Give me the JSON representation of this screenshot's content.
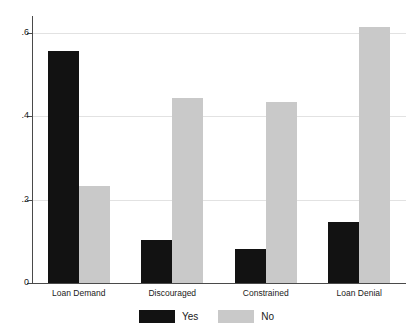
{
  "chart_data": {
    "type": "bar",
    "title": "",
    "subtitle": "",
    "xlabel": "",
    "ylabel": "",
    "categories": [
      "Loan Demand",
      "Discouraged",
      "Constrained",
      "Loan Denial"
    ],
    "series": [
      {
        "name": "Yes",
        "color": "#121212",
        "values": [
          0.558,
          0.103,
          0.082,
          0.146
        ]
      },
      {
        "name": "No",
        "color": "#c9c9c9",
        "values": [
          0.233,
          0.443,
          0.434,
          0.614
        ]
      }
    ],
    "ylim": [
      0,
      0.65
    ],
    "yticks": [
      0,
      0.2,
      0.4,
      0.6
    ],
    "ytick_labels": [
      "0",
      ".2",
      ".4",
      ".6"
    ],
    "grid": "horizontal",
    "grid_color": "#e2e2e2",
    "legend_position": "bottom",
    "axis_color": "#4a4a4a",
    "background": "#ffffff"
  },
  "legend": {
    "entries": [
      {
        "label": "Yes"
      },
      {
        "label": "No"
      }
    ]
  }
}
